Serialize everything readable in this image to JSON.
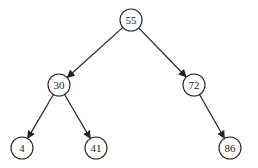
{
  "diagram": {
    "type": "binary-search-tree",
    "node_radius": 11,
    "colors": {
      "stroke": "#222222",
      "fill": "#ffffff",
      "text": "#222222",
      "background": "#ffffff"
    },
    "nodes": [
      {
        "id": "n55",
        "label": "55",
        "x": 131,
        "y": 20
      },
      {
        "id": "n30",
        "label": "30",
        "x": 59,
        "y": 85
      },
      {
        "id": "n72",
        "label": "72",
        "x": 194,
        "y": 85
      },
      {
        "id": "n4",
        "label": "4",
        "x": 22,
        "y": 148
      },
      {
        "id": "n41",
        "label": "41",
        "x": 96,
        "y": 148
      },
      {
        "id": "n86",
        "label": "86",
        "x": 230,
        "y": 148
      }
    ],
    "edges": [
      {
        "from": "n55",
        "to": "n30"
      },
      {
        "from": "n55",
        "to": "n72"
      },
      {
        "from": "n30",
        "to": "n4"
      },
      {
        "from": "n30",
        "to": "n41"
      },
      {
        "from": "n72",
        "to": "n86"
      }
    ]
  }
}
